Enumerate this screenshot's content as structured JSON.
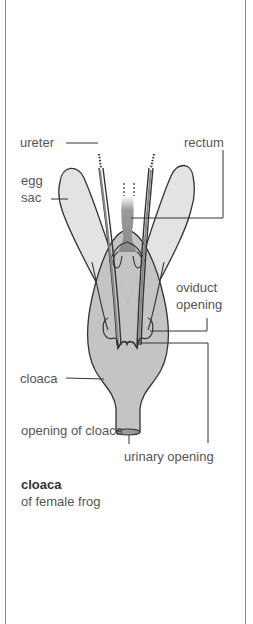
{
  "diagram": {
    "labels": {
      "ureter": "ureter",
      "rectum": "rectum",
      "egg_sac_line1": "egg",
      "egg_sac_line2": "sac",
      "oviduct_opening_line1": "oviduct",
      "oviduct_opening_line2": "opening",
      "cloaca": "cloaca",
      "opening_of_cloaca": "opening of cloaca",
      "urinary_opening": "urinary opening"
    },
    "caption": {
      "title": "cloaca",
      "subtitle": "of female frog"
    },
    "colors": {
      "outline": "#333333",
      "egg_sac_fill": "#e3e3e3",
      "cloaca_fill": "#c4c4c4",
      "rectum_fill": "#8f8f8f",
      "leader_line": "#333333",
      "border": "#8a8a8a"
    }
  }
}
